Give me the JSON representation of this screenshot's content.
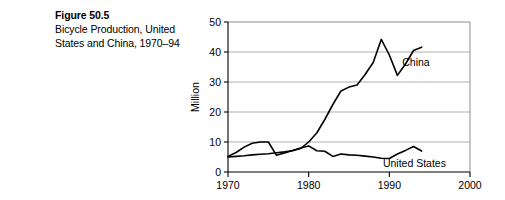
{
  "caption": {
    "figure_number": "Figure 50.5",
    "description_line1": "Bicycle Production, United",
    "description_line2": "States and China, 1970–94"
  },
  "chart_data": {
    "type": "line",
    "title": "",
    "xlabel": "",
    "ylabel": "Million",
    "xlim": [
      1970,
      2000
    ],
    "ylim": [
      0,
      50
    ],
    "xticks": [
      1970,
      1980,
      1990,
      2000
    ],
    "yticks": [
      0,
      10,
      20,
      30,
      40,
      50
    ],
    "xtick_labels": [
      "1970",
      "1980",
      "1990",
      "2000"
    ],
    "ytick_labels": [
      "0",
      "10",
      "20",
      "30",
      "40",
      "50"
    ],
    "grid": "horizontal",
    "legend_position": "inline-annotation",
    "x": [
      1970,
      1971,
      1972,
      1973,
      1974,
      1975,
      1976,
      1977,
      1978,
      1979,
      1980,
      1981,
      1982,
      1983,
      1984,
      1985,
      1986,
      1987,
      1988,
      1989,
      1990,
      1991,
      1992,
      1993,
      1994
    ],
    "series": [
      {
        "name": "China",
        "label": "China",
        "color": "#000000",
        "values": [
          5.0,
          5.2,
          5.4,
          5.7,
          5.9,
          6.1,
          6.4,
          6.7,
          7.1,
          7.8,
          10.0,
          13.0,
          17.5,
          22.5,
          27.0,
          28.3,
          29.0,
          32.5,
          36.5,
          44.2,
          39.0,
          32.2,
          36.0,
          40.5,
          41.6
        ]
      },
      {
        "name": "United States",
        "label": "United States",
        "color": "#000000",
        "values": [
          5.2,
          6.5,
          8.3,
          9.6,
          10.0,
          10.0,
          5.6,
          6.3,
          7.2,
          8.0,
          8.7,
          7.1,
          6.9,
          5.2,
          6.0,
          5.7,
          5.6,
          5.3,
          5.0,
          4.6,
          4.5,
          6.0,
          7.2,
          8.5,
          7.0
        ]
      }
    ],
    "annotations": [
      {
        "text": "China",
        "x": 1991.6,
        "y": 36.5
      },
      {
        "text": "United States",
        "x": 1989.2,
        "y": 3.0
      }
    ]
  }
}
